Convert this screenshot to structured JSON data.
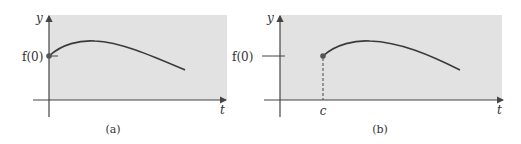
{
  "panels": [
    {
      "id": "a",
      "caption": "(a)",
      "y_axis_label": "y",
      "x_axis_label": "t",
      "y_tick_label": "f(0)",
      "start_point": "t = 0, y = f(0)",
      "x_tick_label": ""
    },
    {
      "id": "b",
      "caption": "(b)",
      "y_axis_label": "y",
      "x_axis_label": "t",
      "y_tick_label": "f(0)",
      "start_point": "t = c, y = f(0)",
      "x_tick_label": "c"
    }
  ],
  "colors": {
    "background": "#ffffff",
    "shaded_region": "#e2e2e2",
    "axis": "#444444",
    "curve": "#3a3a3a",
    "point": "#555555"
  }
}
